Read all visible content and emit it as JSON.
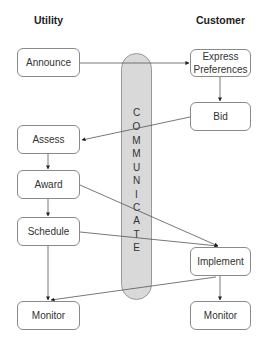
{
  "headers": {
    "left": "Utility",
    "right": "Customer"
  },
  "utility_steps": [
    "Announce",
    "Assess",
    "Award",
    "Schedule",
    "Monitor"
  ],
  "customer_steps": [
    "Express Preferences",
    "Bid",
    "Implement",
    "Monitor"
  ],
  "channel": {
    "label": "COMMUNICATE",
    "letters": [
      "C",
      "O",
      "M",
      "M",
      "U",
      "N",
      "I",
      "C",
      "A",
      "T",
      "E"
    ],
    "fill": "#d9d9d9"
  },
  "connections": [
    {
      "from": "Announce",
      "to": "Express Preferences"
    },
    {
      "from": "Express Preferences",
      "to": "Bid"
    },
    {
      "from": "Bid",
      "to": "Assess"
    },
    {
      "from": "Assess",
      "to": "Award"
    },
    {
      "from": "Award",
      "to": "Schedule"
    },
    {
      "from": "Award",
      "to": "Implement"
    },
    {
      "from": "Schedule",
      "to": "Implement"
    },
    {
      "from": "Schedule",
      "to": "Monitor (Utility)"
    },
    {
      "from": "Implement",
      "to": "Monitor (Utility)"
    },
    {
      "from": "Implement",
      "to": "Monitor (Customer)"
    }
  ]
}
